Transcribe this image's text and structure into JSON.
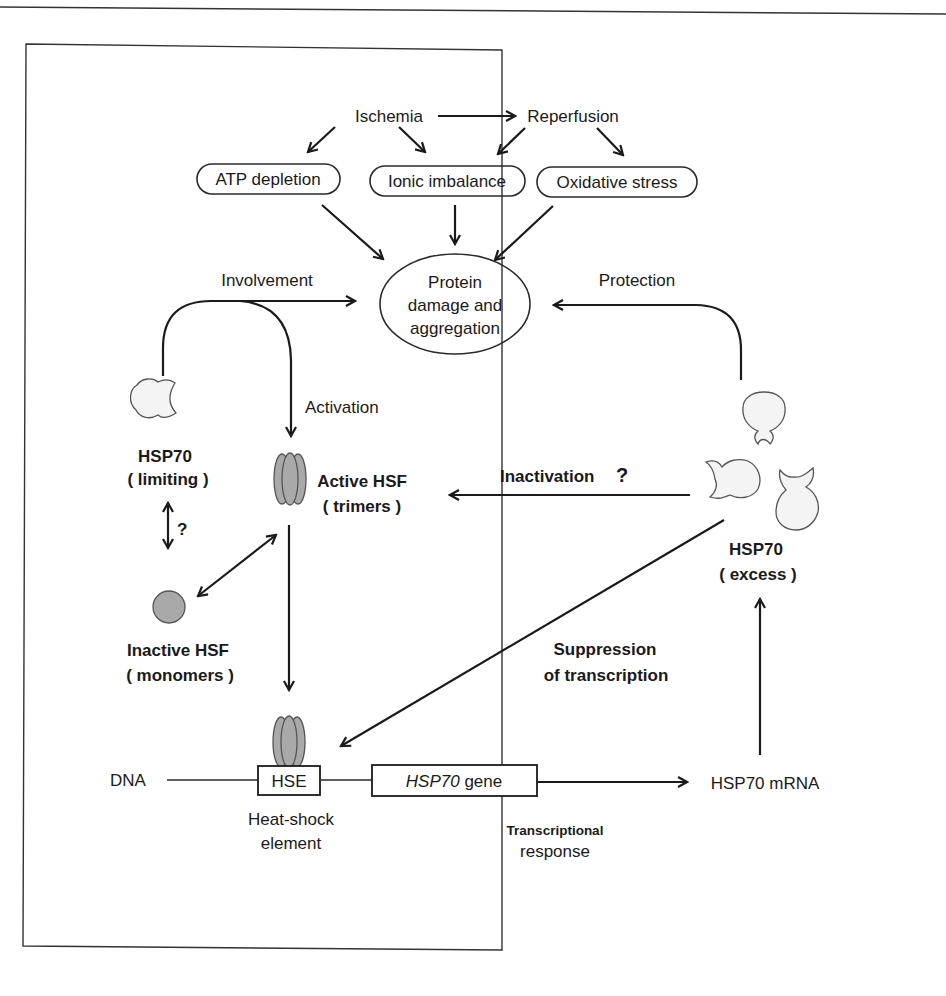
{
  "figure": {
    "colors": {
      "line": "#1a1a1a",
      "hsf_fill": "#a9a9a9",
      "hsp70_fill": "#f4f4f4",
      "background": "#ffffff"
    }
  },
  "top": {
    "ischemia": "Ischemia",
    "reperfusion": "Reperfusion",
    "atp_depletion": "ATP  depletion",
    "ionic_imbalance": "Ionic  imbalance",
    "oxidative_stress": "Oxidative  stress"
  },
  "center": {
    "protein_line1": "Protein",
    "protein_line2": "damage  and",
    "protein_line3": "aggregation"
  },
  "edges": {
    "involvement": "Involvement",
    "protection": "Protection",
    "activation": "Activation",
    "inactivation": "Inactivation",
    "inactivation_q": "?",
    "equilibrium_q": "?",
    "suppression_line1": "Suppression",
    "suppression_line2": "of  transcription"
  },
  "nodes": {
    "hsp70_limiting_line1": "HSP70",
    "hsp70_limiting_line2": "( limiting )",
    "active_hsf_line1": "Active  HSF",
    "active_hsf_line2": "( trimers )",
    "inactive_hsf_line1": "Inactive  HSF",
    "inactive_hsf_line2": "( monomers )",
    "hsp70_excess_line1": "HSP70",
    "hsp70_excess_line2": "( excess )"
  },
  "gene": {
    "dna": "DNA",
    "hse": "HSE",
    "gene_italic": "HSP70",
    "gene_suffix": "gene",
    "mrna": "HSP70 mRNA",
    "hse_caption_line1": "Heat-shock",
    "hse_caption_line2": "element",
    "transcriptional_line1": "Transcriptional",
    "transcriptional_line2": "response"
  }
}
